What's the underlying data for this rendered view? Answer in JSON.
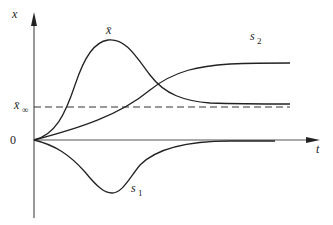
{
  "diagram": {
    "axes": {
      "y_label": "x",
      "x_label": "t",
      "origin_label": "0"
    },
    "reference_line": {
      "label": "x̄",
      "subscript": "∞",
      "style": "dashed"
    },
    "curves": [
      {
        "id": "x-bar",
        "label": "x̄",
        "description": "rises from 0, overshoots to a peak, then settles to x̄∞"
      },
      {
        "id": "s2",
        "label": "s",
        "subscript": "2",
        "description": "rises monotonically and saturates above x̄∞"
      },
      {
        "id": "s1",
        "label": "s",
        "subscript": "1",
        "description": "dips below zero to a minimum, then returns to 0"
      }
    ],
    "colors": {
      "line": "#222222",
      "axis": "#555555",
      "background": "#ffffff"
    }
  }
}
